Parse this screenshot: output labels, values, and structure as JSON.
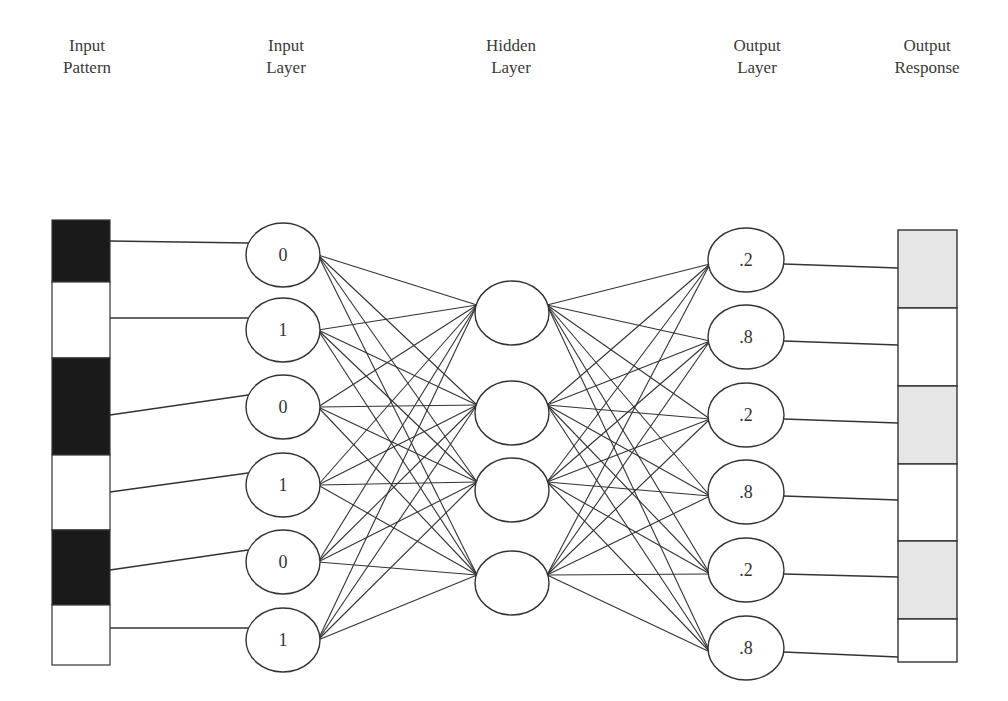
{
  "columns": [
    {
      "id": "input_pattern",
      "line1": "Input",
      "line2": "Pattern",
      "cx": 80
    },
    {
      "id": "input_layer",
      "line1": "Input",
      "line2": "Layer",
      "cx": 285
    },
    {
      "id": "hidden_layer",
      "line1": "Hidden",
      "line2": "Layer",
      "cx": 512
    },
    {
      "id": "output_layer",
      "line1": "Output",
      "line2": "Layer",
      "cx": 745
    },
    {
      "id": "output_response",
      "line1": "Output",
      "line2": "Response",
      "cx": 925
    }
  ],
  "input_pattern": {
    "x": 52,
    "width": 58,
    "segments": [
      {
        "y": 220,
        "h": 62,
        "fill": "#1a1a1a",
        "value": "dark"
      },
      {
        "y": 282,
        "h": 76,
        "fill": "#ffffff",
        "value": "light"
      },
      {
        "y": 358,
        "h": 97,
        "fill": "#1a1a1a",
        "value": "dark"
      },
      {
        "y": 455,
        "h": 75,
        "fill": "#ffffff",
        "value": "light"
      },
      {
        "y": 530,
        "h": 75,
        "fill": "#1a1a1a",
        "value": "dark"
      },
      {
        "y": 605,
        "h": 60,
        "fill": "#ffffff",
        "value": "light"
      }
    ],
    "line_ys": [
      241,
      318,
      415,
      492,
      570,
      628
    ]
  },
  "input_layer": {
    "cx": 283,
    "rx": 37,
    "ry": 32,
    "nodes": [
      {
        "cy": 255,
        "label": "0"
      },
      {
        "cy": 330,
        "label": "1"
      },
      {
        "cy": 407,
        "label": "0"
      },
      {
        "cy": 485,
        "label": "1"
      },
      {
        "cy": 562,
        "label": "0"
      },
      {
        "cy": 640,
        "label": "1"
      }
    ]
  },
  "hidden_layer": {
    "cx": 512,
    "rx": 37,
    "ry": 32,
    "nodes": [
      {
        "cy": 313,
        "label": ""
      },
      {
        "cy": 413,
        "label": ""
      },
      {
        "cy": 490,
        "label": ""
      },
      {
        "cy": 583,
        "label": ""
      }
    ]
  },
  "output_layer": {
    "cx": 746,
    "rx": 38,
    "ry": 32,
    "nodes": [
      {
        "cy": 260,
        "label": ".2"
      },
      {
        "cy": 337,
        "label": ".8"
      },
      {
        "cy": 415,
        "label": ".2"
      },
      {
        "cy": 492,
        "label": ".8"
      },
      {
        "cy": 570,
        "label": ".2"
      },
      {
        "cy": 648,
        "label": ".8"
      }
    ]
  },
  "output_response": {
    "x": 898,
    "width": 59,
    "segments": [
      {
        "y": 230,
        "h": 78,
        "fill": "#e6e6e6",
        "value": ".2"
      },
      {
        "y": 308,
        "h": 78,
        "fill": "#ffffff",
        "value": ".8"
      },
      {
        "y": 386,
        "h": 78,
        "fill": "#e6e6e6",
        "value": ".2"
      },
      {
        "y": 464,
        "h": 77,
        "fill": "#ffffff",
        "value": ".8"
      },
      {
        "y": 541,
        "h": 78,
        "fill": "#e6e6e6",
        "value": ".2"
      },
      {
        "y": 619,
        "h": 43,
        "fill": "#ffffff",
        "value": ".8"
      }
    ],
    "line_ys": [
      268,
      345,
      423,
      500,
      577,
      657
    ]
  },
  "colors": {
    "stroke": "#333333",
    "background": "#ffffff"
  }
}
